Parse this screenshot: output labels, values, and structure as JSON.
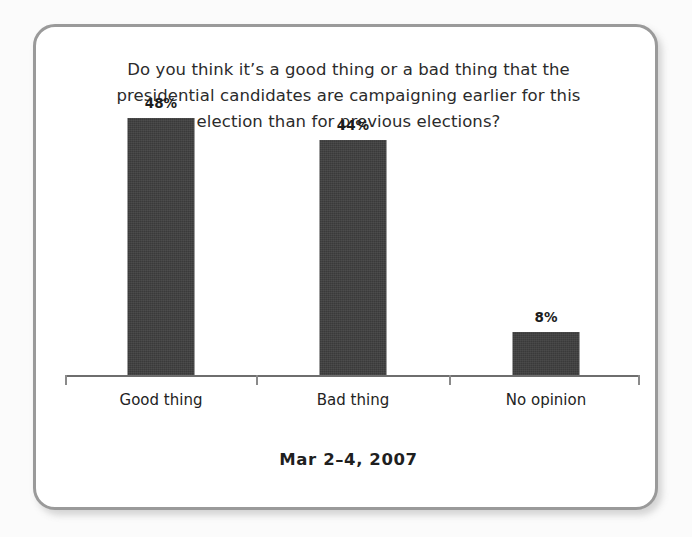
{
  "card": {
    "border_color": "#9a9a9a",
    "background": "#ffffff"
  },
  "page": {
    "background": "#fbfbfb"
  },
  "title": {
    "line1": "Do you think it’s a good thing or a bad thing that the",
    "line2": "presidential candidates are campaigning earlier for this",
    "line3": "election than for previous elections?"
  },
  "footer": {
    "date": "Mar 2–4, 2007"
  },
  "chart_data": {
    "type": "bar",
    "title": "Do you think it’s a good thing or a bad thing that the presidential candidates are campaigning earlier for this election than for previous elections?",
    "subtitle": "Mar 2–4, 2007",
    "categories": [
      "Good thing",
      "Bad thing",
      "No opinion"
    ],
    "values": [
      48,
      44,
      8
    ],
    "value_labels": [
      "48%",
      "44%",
      "8%"
    ],
    "xlabel": "",
    "ylabel": "",
    "ylim": [
      0,
      52
    ],
    "grid": false,
    "legend": false,
    "bar_color": "#3a3a3a",
    "axis_color": "#6e6e6e",
    "units": "percent"
  }
}
